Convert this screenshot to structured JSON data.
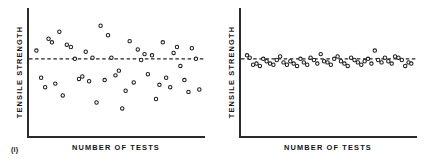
{
  "figure": {
    "background": "#ffffff",
    "ink_color": "#1d1d1d"
  },
  "panels": [
    {
      "tag": "(i)",
      "name": "high-scatter-panel",
      "xlabel": "NUMBER OF TESTS",
      "ylabel": "TENSILE STRENGTH"
    },
    {
      "tag": "(ii)",
      "name": "low-scatter-panel",
      "xlabel": "NUMBER  OF  TESTS",
      "ylabel": "TENSILE STRENGTH"
    }
  ],
  "chart_data": [
    {
      "type": "scatter",
      "title": "(i)",
      "xlabel": "NUMBER OF TESTS",
      "ylabel": "TENSILE STRENGTH",
      "xlim": [
        0,
        50
      ],
      "ylim": [
        0,
        100
      ],
      "grid": false,
      "legend": null,
      "mean_line": {
        "y": 62,
        "style": "dashed",
        "label": "mean tensile strength"
      },
      "description": "Large scatter of tensile strength about the mean",
      "x": [
        1,
        2.4,
        3.6,
        4.6,
        5.6,
        6.6,
        7.8,
        8.8,
        10.0,
        11.2,
        12.4,
        13.6,
        14.6,
        15.6,
        16.6,
        17.6,
        18.8,
        20.0,
        21.2,
        22.2,
        23.2,
        24.4,
        25.4,
        26.4,
        27.4,
        28.6,
        29.8,
        31.0,
        32.0,
        33.0,
        34.0,
        35.2,
        36.4,
        37.4,
        38.4,
        39.4,
        40.6,
        41.6,
        42.6,
        43.6,
        44.8,
        46.0,
        47.0,
        48.2,
        49.2
      ],
      "y": [
        69,
        46,
        38,
        79,
        76,
        41,
        85,
        31,
        74,
        72,
        62,
        45,
        47,
        68,
        43,
        63,
        25,
        90,
        44,
        82,
        63,
        48,
        52,
        20,
        35,
        77,
        42,
        70,
        61,
        66,
        49,
        65,
        28,
        40,
        76,
        46,
        38,
        67,
        72,
        56,
        44,
        34,
        71,
        62,
        36
      ]
    },
    {
      "type": "scatter",
      "title": "(ii)",
      "xlabel": "NUMBER  OF  TESTS",
      "ylabel": "TENSILE STRENGTH",
      "xlim": [
        0,
        50
      ],
      "ylim": [
        0,
        100
      ],
      "grid": false,
      "legend": null,
      "mean_line": {
        "y": 62,
        "style": "dashed",
        "label": "mean tensile strength"
      },
      "description": "Small scatter of tensile strength about the mean",
      "x": [
        0.6,
        1.4,
        2.4,
        3.4,
        4.4,
        5.4,
        6.4,
        7.4,
        8.4,
        9.4,
        10.4,
        11.4,
        12.4,
        13.4,
        14.4,
        15.4,
        16.4,
        17.4,
        18.4,
        19.4,
        20.4,
        21.4,
        22.4,
        23.4,
        24.4,
        25.4,
        26.4,
        27.4,
        28.4,
        29.4,
        30.4,
        31.4,
        32.4,
        33.4,
        34.4,
        35.4,
        36.4,
        37.4,
        38.4,
        39.4,
        40.4,
        41.4,
        42.4,
        43.4,
        44.4,
        45.4,
        46.4,
        47.4,
        48.4,
        49.2
      ],
      "y": [
        65,
        63,
        57,
        58,
        56,
        62,
        60,
        58,
        57,
        61,
        64,
        59,
        57,
        60,
        58,
        56,
        62,
        59,
        57,
        63,
        61,
        58,
        66,
        60,
        59,
        57,
        62,
        64,
        60,
        58,
        56,
        63,
        61,
        59,
        57,
        60,
        62,
        58,
        69,
        61,
        59,
        63,
        60,
        58,
        64,
        63,
        61,
        56,
        59,
        58
      ]
    }
  ]
}
